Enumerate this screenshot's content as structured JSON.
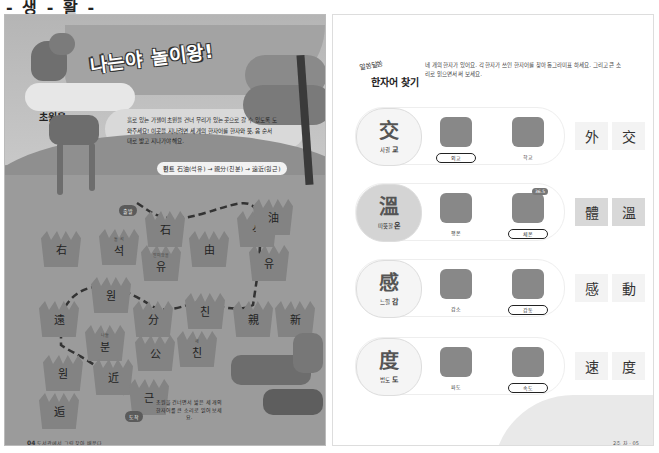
{
  "top_strip": {
    "text": "- 생 - 활 -"
  },
  "left_page": {
    "title": "나는야 놀이왕!",
    "side_title": {
      "line1": "초원을",
      "line2": "건너"
    },
    "description": "흙로 있는 가젤이 초원을 건너 무리가 있는 곳으로 갈 수 있도록 도와주세요! 이곳을 지나려면 세 개의 한자어를 한자와 뜻, 음 순서대로 밟고 지나가야 해요.",
    "hint": {
      "label": "힌트",
      "text": "石油(석유) → 親分(친분) → 遠近(원근)"
    },
    "start_label": "출발",
    "end_label": "도착",
    "tiles": [
      {
        "hanja": "石",
        "gloss": ""
      },
      {
        "hanja": "右",
        "gloss": ""
      },
      {
        "hanja": "석",
        "gloss": "돌 석"
      },
      {
        "hanja": "유",
        "gloss": "말미암을"
      },
      {
        "hanja": "由",
        "gloss": ""
      },
      {
        "hanja": "석",
        "gloss": ""
      },
      {
        "hanja": "油",
        "gloss": ""
      },
      {
        "hanja": "유",
        "gloss": ""
      },
      {
        "hanja": "遠",
        "gloss": ""
      },
      {
        "hanja": "원",
        "gloss": ""
      },
      {
        "hanja": "分",
        "gloss": ""
      },
      {
        "hanja": "친",
        "gloss": ""
      },
      {
        "hanja": "親",
        "gloss": ""
      },
      {
        "hanja": "新",
        "gloss": ""
      },
      {
        "hanja": "분",
        "gloss": "나눌"
      },
      {
        "hanja": "公",
        "gloss": ""
      },
      {
        "hanja": "친",
        "gloss": "새"
      },
      {
        "hanja": "원",
        "gloss": ""
      },
      {
        "hanja": "近",
        "gloss": ""
      },
      {
        "hanja": "근",
        "gloss": ""
      },
      {
        "hanja": "逅",
        "gloss": ""
      }
    ],
    "note": "초원을 건너면서 밟은 세 개의 한자어를 큰 소리로 읽어 보세요.",
    "page_number": "04",
    "page_footer": "도서관에서 그림 찾아 배운다"
  },
  "right_page": {
    "header_small": "알쏭달쏭",
    "header_big": "한자어 찾기",
    "description": "네 개의 한자가 있어요. 각 한자가 쓰인 한자어를 찾아 동그라미표 하세요. 그리고 큰 소리로 읽으면서 써 보세요.",
    "rows": [
      {
        "hanja": "交",
        "meaning": "사귈",
        "sound": "교",
        "pictures": [
          {
            "icon": "un-emblem-icon",
            "label": "외교",
            "circled": true
          },
          {
            "icon": "school-icon",
            "label": "학교",
            "circled": false
          }
        ],
        "answer": [
          "外",
          "交"
        ],
        "shaded": false
      },
      {
        "hanja": "溫",
        "meaning": "따뜻할",
        "sound": "온",
        "pictures": [
          {
            "icon": "meditation-icon",
            "label": "평온",
            "circled": false
          },
          {
            "icon": "thermometer-person-icon",
            "label": "체온",
            "circled": true,
            "bubble": "36.5"
          }
        ],
        "answer": [
          "體",
          "溫"
        ],
        "shaded": true
      },
      {
        "hanja": "感",
        "meaning": "느낄",
        "sound": "감",
        "pictures": [
          {
            "icon": "decline-chart-icon",
            "label": "감소",
            "circled": false
          },
          {
            "icon": "moved-person-icon",
            "label": "감동",
            "circled": true
          }
        ],
        "answer": [
          "感",
          "動"
        ],
        "shaded": false
      },
      {
        "hanja": "度",
        "meaning": "법도",
        "sound": "도",
        "pictures": [
          {
            "icon": "wave-icon",
            "label": "파도",
            "circled": false
          },
          {
            "icon": "speed-train-icon",
            "label": "속도",
            "circled": true
          }
        ],
        "answer": [
          "速",
          "度"
        ],
        "shaded": false
      }
    ],
    "page_footer": "2주 차 · 05"
  }
}
